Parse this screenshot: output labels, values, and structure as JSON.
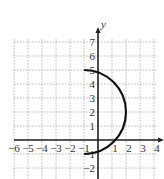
{
  "chart_data": {
    "type": "line",
    "title": "",
    "xlabel": "",
    "ylabel": "y",
    "xlim": [
      -6,
      4
    ],
    "ylim": [
      -2,
      7
    ],
    "grid": true,
    "x_ticks": [
      "−6",
      "−5",
      "−4",
      "−3",
      "−2",
      "−1",
      "1",
      "2",
      "3",
      "4"
    ],
    "y_ticks": [
      "7",
      "6",
      "5",
      "4",
      "3",
      "2",
      "1",
      "−1",
      "−2"
    ],
    "series": [
      {
        "name": "semicircle",
        "description": "Right half of circle centered at (-1, 2) with radius 3, from (-1, 5) to (-1, -1)",
        "center": [
          -1,
          2
        ],
        "radius": 3,
        "endpoints": [
          [
            -1,
            5
          ],
          [
            -1,
            -1
          ]
        ],
        "rightmost": [
          2,
          2
        ]
      }
    ]
  }
}
